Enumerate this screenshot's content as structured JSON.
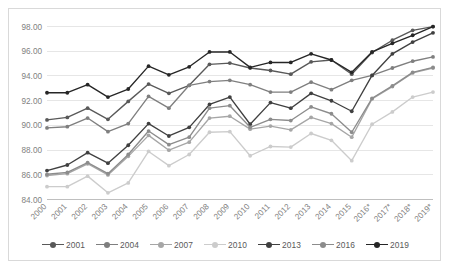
{
  "chart_data": {
    "type": "line",
    "title": "",
    "subtitle": "",
    "xlabel": "",
    "ylabel": "",
    "ylim": [
      84.0,
      98.0
    ],
    "ytick_step": 2.0,
    "yticks": [
      "84.00",
      "86.00",
      "88.00",
      "90.00",
      "92.00",
      "94.00",
      "96.00",
      "98.00"
    ],
    "grid": "horizontal",
    "legend_position": "bottom",
    "categories": [
      "2000",
      "2001",
      "2002",
      "2003",
      "2004",
      "2005",
      "2006",
      "2007",
      "2008",
      "2009",
      "2010",
      "2011",
      "2012",
      "2013",
      "2014",
      "2015",
      "2016*",
      "2017*",
      "2018*",
      "2019*"
    ],
    "series": [
      {
        "name": "2001",
        "color": "#595959",
        "values": [
          90.4,
          90.6,
          91.35,
          90.45,
          91.9,
          93.3,
          92.55,
          93.2,
          94.9,
          95.0,
          94.6,
          94.4,
          94.1,
          95.1,
          95.25,
          94.1,
          95.85,
          96.85,
          97.65,
          97.95
        ]
      },
      {
        "name": "2004",
        "color": "#7f7f7f",
        "values": [
          89.75,
          89.85,
          90.55,
          89.45,
          90.1,
          92.3,
          91.35,
          93.2,
          93.5,
          93.6,
          93.25,
          92.65,
          92.65,
          93.45,
          92.85,
          93.6,
          94.0,
          94.6,
          95.15,
          95.5
        ]
      },
      {
        "name": "2007",
        "color": "#a6a6a6",
        "values": [
          85.9,
          86.05,
          86.85,
          85.95,
          87.45,
          89.15,
          87.95,
          88.6,
          90.55,
          90.7,
          89.65,
          89.9,
          89.6,
          90.6,
          90.1,
          89.0,
          92.1,
          93.1,
          94.2,
          94.6
        ]
      },
      {
        "name": "2010",
        "color": "#cccccc",
        "values": [
          85.0,
          85.0,
          85.85,
          84.5,
          85.3,
          87.85,
          86.7,
          87.6,
          89.4,
          89.45,
          87.5,
          88.25,
          88.2,
          89.3,
          88.75,
          87.1,
          90.05,
          91.05,
          92.25,
          92.65
        ]
      },
      {
        "name": "2013",
        "color": "#404040",
        "values": [
          86.3,
          86.75,
          87.75,
          86.9,
          88.35,
          90.1,
          89.1,
          89.8,
          91.65,
          92.25,
          90.05,
          91.8,
          91.35,
          92.55,
          91.95,
          91.1,
          94.0,
          95.75,
          96.7,
          97.45
        ]
      },
      {
        "name": "2016",
        "color": "#8c8c8c",
        "values": [
          86.0,
          86.15,
          86.95,
          86.05,
          87.6,
          89.5,
          88.4,
          89.0,
          91.35,
          91.55,
          89.8,
          90.45,
          90.35,
          91.45,
          90.9,
          89.4,
          92.15,
          93.15,
          94.25,
          94.65
        ]
      },
      {
        "name": "2019",
        "color": "#262626",
        "values": [
          92.6,
          92.6,
          93.25,
          92.25,
          92.9,
          94.75,
          94.05,
          94.7,
          95.9,
          95.9,
          94.65,
          95.05,
          95.05,
          95.75,
          95.25,
          94.25,
          95.9,
          96.6,
          97.25,
          97.95
        ]
      }
    ]
  },
  "legend": {
    "items": [
      {
        "label": "2001"
      },
      {
        "label": "2004"
      },
      {
        "label": "2007"
      },
      {
        "label": "2010"
      },
      {
        "label": "2013"
      },
      {
        "label": "2016"
      },
      {
        "label": "2019"
      }
    ]
  }
}
